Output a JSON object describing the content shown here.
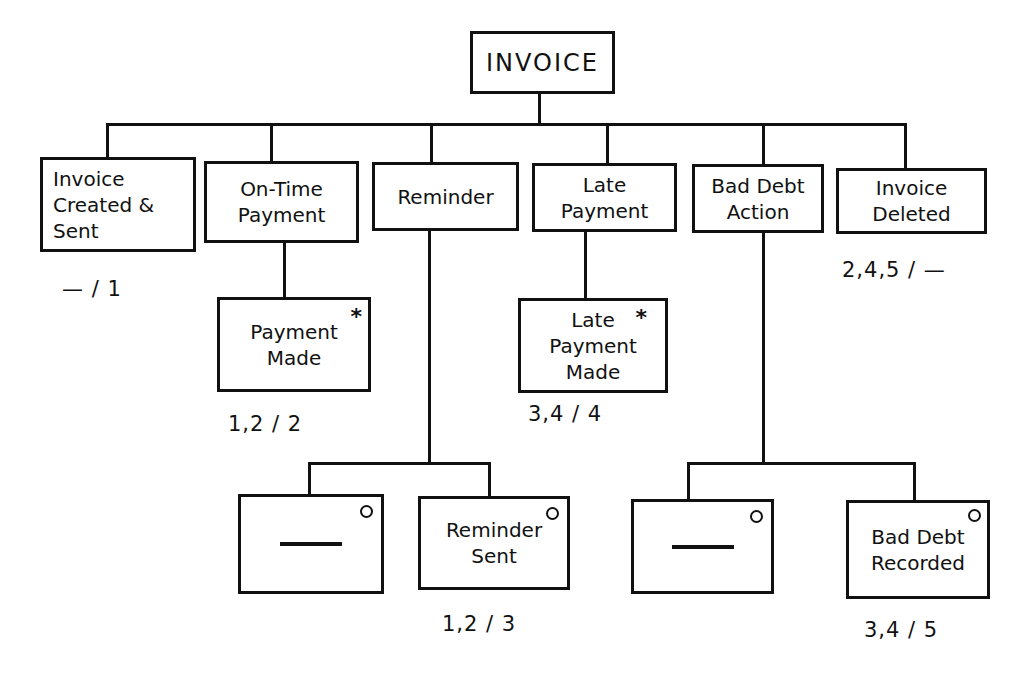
{
  "root": {
    "label": "INVOICE"
  },
  "children": [
    {
      "lines": [
        "Invoice",
        "Created &",
        "Sent"
      ],
      "note": "— / 1"
    },
    {
      "lines": [
        "On-Time",
        "Payment"
      ]
    },
    {
      "lines": [
        "Reminder"
      ]
    },
    {
      "lines": [
        "Late",
        "Payment"
      ]
    },
    {
      "lines": [
        "Bad Debt",
        "Action"
      ]
    },
    {
      "lines": [
        "Invoice",
        "Deleted"
      ],
      "note": "2,4,5 / —"
    }
  ],
  "subnodes": {
    "payment_made": {
      "lines": [
        "Payment",
        "Made"
      ],
      "marker": "*",
      "note": "1,2 / 2"
    },
    "late_payment_made": {
      "lines": [
        "Late",
        "Payment",
        "Made"
      ],
      "marker": "*",
      "note": "3,4 / 4"
    },
    "reminder_null": {
      "label": "—",
      "marker": "o"
    },
    "reminder_sent": {
      "lines": [
        "Reminder",
        "Sent"
      ],
      "marker": "o",
      "note": "1,2 / 3"
    },
    "bad_debt_null": {
      "label": "—",
      "marker": "o"
    },
    "bad_debt_recorded": {
      "lines": [
        "Bad Debt",
        "Recorded"
      ],
      "marker": "o",
      "note": "3,4 / 5"
    }
  }
}
